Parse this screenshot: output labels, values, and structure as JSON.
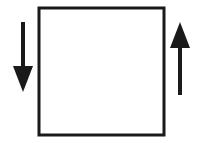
{
  "diagram": {
    "top_labels": [
      "1",
      "2",
      "3",
      "4",
      "5",
      "6",
      "7",
      "8"
    ],
    "bottom_labels": [
      "1",
      "2",
      "3",
      "4",
      "5",
      "6",
      "7",
      "8"
    ],
    "left_arrow": "down",
    "right_arrow": "up",
    "color": "#1a1a1a"
  }
}
